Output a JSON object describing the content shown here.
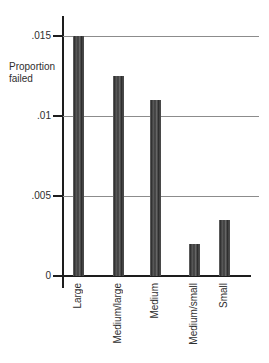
{
  "figure": {
    "ylabel_text": "Proportion\nfailed"
  },
  "chart_data": {
    "type": "bar",
    "title": "",
    "xlabel": "",
    "ylabel": "Proportion failed",
    "categories": [
      "Large",
      "Medium/large",
      "Medium",
      "Medium/small",
      "Small"
    ],
    "values": [
      0.015,
      0.0125,
      0.011,
      0.002,
      0.0035
    ],
    "ylim": [
      0,
      0.0163
    ],
    "yticks": [
      {
        "value": 0,
        "label": "0"
      },
      {
        "value": 0.005,
        "label": ".005"
      },
      {
        "value": 0.01,
        "label": ".01"
      },
      {
        "value": 0.015,
        "label": ".015"
      }
    ],
    "grid": "horizontal",
    "legend": "none",
    "x_label_orientation": "vertical-bottom-to-top",
    "bar_color": "#4a4a4a",
    "axis_color": "#1d1d1d",
    "gridline_color": "#8c8c8c",
    "text_color": "#2e2e2e",
    "background_color": "#ffffff"
  }
}
